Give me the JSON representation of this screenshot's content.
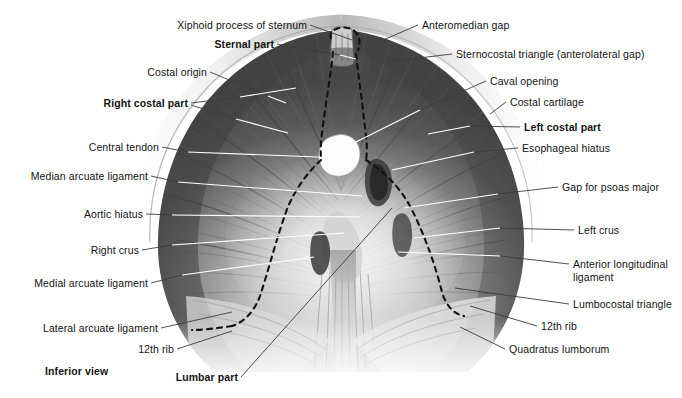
{
  "figure": {
    "view_caption": "Inferior view",
    "background_color": "#ffffff",
    "text_color": "#141414",
    "leader_line_light_color": "#ffffff",
    "leader_line_dark_color": "#3c3c3c",
    "dashed_outline_color": "#111111"
  },
  "labels_left": [
    {
      "id": "xiphoid-process-of-sternum",
      "text": "Xiphoid process of sternum",
      "bold": false,
      "x": 164,
      "y": 19,
      "anchor_x": 310,
      "anchor_y": 25,
      "target_x": 352,
      "target_y": 40
    },
    {
      "id": "sternal-part",
      "text": "Sternal part",
      "bold": true,
      "x": 205,
      "y": 38,
      "anchor_x": 277,
      "anchor_y": 44,
      "target_x": 356,
      "target_y": 59
    },
    {
      "id": "costal-origin",
      "text": "Costal origin",
      "bold": false,
      "x": 142,
      "y": 66,
      "anchor_x": 210,
      "anchor_y": 72,
      "target_x": 283,
      "target_y": 101
    },
    {
      "id": "right-costal-part",
      "text": "Right costal part",
      "bold": true,
      "x": 88,
      "y": 97,
      "anchor_x": 191,
      "anchor_y": 103,
      "target_x": 293,
      "target_y": 90
    },
    {
      "id": "right-costal-part-2",
      "text": "",
      "bold": false,
      "x": 0,
      "y": 0,
      "anchor_x": 191,
      "anchor_y": 105,
      "target_x": 283,
      "target_y": 131
    },
    {
      "id": "central-tendon",
      "text": "Central tendon",
      "bold": false,
      "x": 78,
      "y": 141,
      "anchor_x": 162,
      "anchor_y": 147,
      "target_x": 341,
      "target_y": 157
    },
    {
      "id": "median-arcuate-ligament",
      "text": "Median arcuate ligament",
      "bold": false,
      "x": 20,
      "y": 170,
      "anchor_x": 151,
      "anchor_y": 176,
      "target_x": 362,
      "target_y": 196
    },
    {
      "id": "aortic-hiatus",
      "text": "Aortic hiatus",
      "bold": false,
      "x": 74,
      "y": 208,
      "anchor_x": 146,
      "anchor_y": 214,
      "target_x": 362,
      "target_y": 216
    },
    {
      "id": "right-crus",
      "text": "Right crus",
      "bold": false,
      "x": 84,
      "y": 244,
      "anchor_x": 142,
      "anchor_y": 250,
      "target_x": 345,
      "target_y": 232
    },
    {
      "id": "medial-arcuate-ligament",
      "text": "Medial arcuate ligament",
      "bold": false,
      "x": 22,
      "y": 277,
      "anchor_x": 151,
      "anchor_y": 283,
      "target_x": 313,
      "target_y": 257
    },
    {
      "id": "lateral-arcuate-ligament",
      "text": "Lateral arcuate ligament",
      "bold": false,
      "x": 33,
      "y": 322,
      "anchor_x": 161,
      "anchor_y": 328,
      "target_x": 265,
      "target_y": 312
    },
    {
      "id": "12th-rib-left",
      "text": "12th rib",
      "bold": false,
      "x": 141,
      "y": 347,
      "anchor_x": 177,
      "anchor_y": 349,
      "target_x": 232,
      "target_y": 331
    },
    {
      "id": "lumbar-part",
      "text": "Lumbar part",
      "bold": true,
      "x": 166,
      "y": 374,
      "anchor_x": 241,
      "anchor_y": 377,
      "target_x": 390,
      "target_y": 212
    },
    {
      "id": "inferior-view",
      "text": "Inferior view",
      "bold": true,
      "x": 45,
      "y": 367,
      "anchor_x": 0,
      "anchor_y": 0,
      "target_x": 0,
      "target_y": 0
    }
  ],
  "labels_right": [
    {
      "id": "anteromedian-gap",
      "text": "Anteromedian gap",
      "bold": false,
      "x": 422,
      "y": 19,
      "anchor_x": 418,
      "anchor_y": 25,
      "target_x": 372,
      "target_y": 44
    },
    {
      "id": "sternocostal-triangle",
      "text": "Sternocostal triangle (anterolateral gap)",
      "bold": false,
      "x": 456,
      "y": 48,
      "anchor_x": 452,
      "anchor_y": 54,
      "target_x": 385,
      "target_y": 60
    },
    {
      "id": "caval-opening",
      "text": "Caval opening",
      "bold": false,
      "x": 490,
      "y": 75,
      "anchor_x": 486,
      "anchor_y": 81,
      "target_x": 348,
      "target_y": 144
    },
    {
      "id": "costal-cartilage",
      "text": "Costal cartilage",
      "bold": false,
      "x": 510,
      "y": 96,
      "anchor_x": 506,
      "anchor_y": 102,
      "target_x": 487,
      "target_y": 115
    },
    {
      "id": "left-costal-part",
      "text": "Left costal part",
      "bold": true,
      "x": 524,
      "y": 121,
      "anchor_x": 520,
      "anchor_y": 127,
      "target_x": 430,
      "target_y": 135
    },
    {
      "id": "esophageal-hiatus",
      "text": "Esophageal hiatus",
      "bold": false,
      "x": 522,
      "y": 142,
      "anchor_x": 518,
      "anchor_y": 148,
      "target_x": 440,
      "target_y": 153
    },
    {
      "id": "gap-for-psoas-major",
      "text": "Gap for psoas major",
      "bold": false,
      "x": 562,
      "y": 181,
      "anchor_x": 558,
      "anchor_y": 187,
      "target_x": 400,
      "target_y": 206
    },
    {
      "id": "left-crus",
      "text": "Left crus",
      "bold": false,
      "x": 578,
      "y": 224,
      "anchor_x": 574,
      "anchor_y": 230,
      "target_x": 418,
      "target_y": 236
    },
    {
      "id": "anterior-longitudinal-ligament",
      "text": "Anterior longitudinal ligament",
      "bold": false,
      "x": 573,
      "y": 258,
      "anchor_x": 569,
      "anchor_y": 264,
      "target_x": 400,
      "target_y": 252
    },
    {
      "id": "lumbocostal-triangle",
      "text": "Lumbocostal triangle",
      "bold": false,
      "x": 573,
      "y": 298,
      "anchor_x": 569,
      "anchor_y": 304,
      "target_x": 455,
      "target_y": 288
    },
    {
      "id": "12th-rib-right",
      "text": "12th rib",
      "bold": false,
      "x": 541,
      "y": 320,
      "anchor_x": 537,
      "anchor_y": 326,
      "target_x": 470,
      "target_y": 306
    },
    {
      "id": "quadratus-lumborum",
      "text": "Quadratus lumborum",
      "bold": false,
      "x": 509,
      "y": 343,
      "anchor_x": 505,
      "anchor_y": 349,
      "target_x": 460,
      "target_y": 327
    }
  ]
}
